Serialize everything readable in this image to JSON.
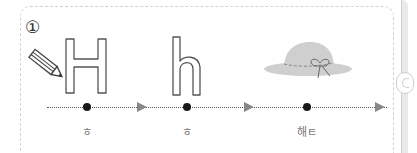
{
  "exercise": {
    "number": "①",
    "items": [
      {
        "letter": "H",
        "sound": "ㅎ"
      },
      {
        "letter": "h",
        "sound": "ㅎ"
      },
      {
        "picture": "hat",
        "sound": "해ㅌ"
      }
    ]
  },
  "colors": {
    "outline": "#555555",
    "dot": "#1a1a1a",
    "hat": "#cfcfcf",
    "border": "#d2d2d2"
  }
}
